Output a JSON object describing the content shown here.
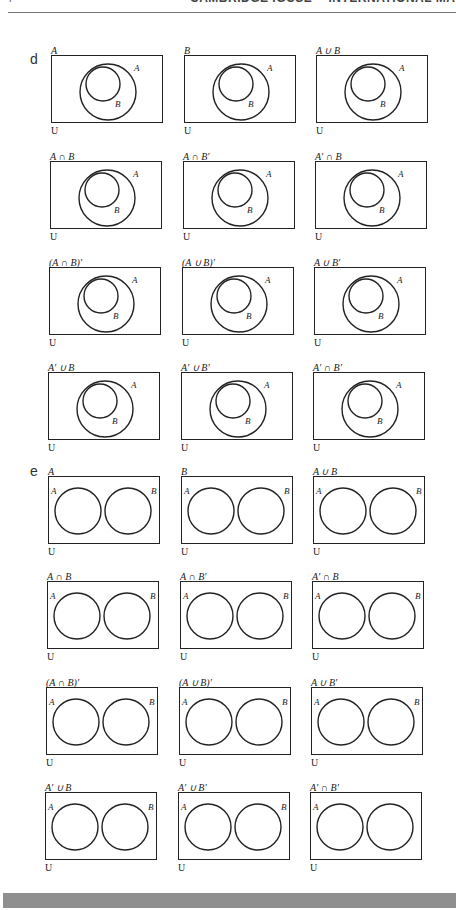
{
  "header": {
    "running_title": "CAMBRIDGE IGCSE™ INTERNATIONAL MATHEMATICS: COURSEBOOK",
    "page_glyph": "7"
  },
  "sections": [
    {
      "letter": "d",
      "type": "nested",
      "inner_label": "B",
      "outer_label": "A",
      "universal_label": "U",
      "panels": [
        {
          "title": "A"
        },
        {
          "title": "B"
        },
        {
          "title": "A ∪ B"
        },
        {
          "title": "A ∩ B"
        },
        {
          "title": "A ∩ B′"
        },
        {
          "title": "A′ ∩ B"
        },
        {
          "title": "(A ∩ B)′"
        },
        {
          "title": "(A ∪ B)′"
        },
        {
          "title": "A ∪ B′"
        },
        {
          "title": "A′ ∪ B"
        },
        {
          "title": "A′ ∪ B′"
        },
        {
          "title": "A′ ∩ B′"
        }
      ]
    },
    {
      "letter": "e",
      "type": "disjoint",
      "left_label": "A",
      "right_label": "B",
      "universal_label": "U",
      "panels": [
        {
          "title": "A",
          "show_b": true
        },
        {
          "title": "B",
          "show_b": true
        },
        {
          "title": "A ∪ B",
          "show_b": true
        },
        {
          "title": "A ∩ B",
          "show_b": true
        },
        {
          "title": "A ∩ B′",
          "show_b": true
        },
        {
          "title": "A′ ∩ B",
          "show_b": true
        },
        {
          "title": "(A ∩ B)′",
          "show_b": true
        },
        {
          "title": "(A ∪ B)′",
          "show_b": true
        },
        {
          "title": "A ∪ B′",
          "show_b": true
        },
        {
          "title": "A′ ∪ B",
          "show_b": true
        },
        {
          "title": "A′ ∪ B′",
          "show_b": true
        },
        {
          "title": "A′ ∩ B′",
          "show_b": false
        }
      ]
    }
  ],
  "colors": {
    "ink": "#222222",
    "footer_band": "#8f8f8f",
    "rule": "#777777"
  }
}
